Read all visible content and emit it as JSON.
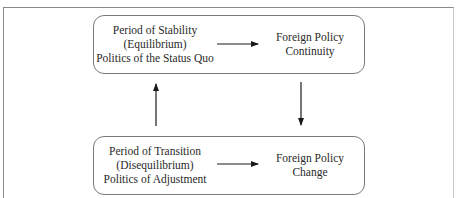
{
  "diagram": {
    "type": "flowchart",
    "nodes": {
      "stability": {
        "lines": [
          "Period of Stability",
          "(Equilibrium)",
          "Politics of the Status Quo"
        ]
      },
      "continuity": {
        "lines": [
          "Foreign Policy",
          "Continuity"
        ]
      },
      "transition": {
        "lines": [
          "Period of Transition",
          "(Disequilibrium)",
          "Politics of Adjustment"
        ]
      },
      "change": {
        "lines": [
          "Foreign Policy",
          "Change"
        ]
      }
    },
    "edges": [
      {
        "from": "stability",
        "to": "continuity",
        "direction": "right"
      },
      {
        "from": "continuity",
        "to": "change",
        "direction": "down"
      },
      {
        "from": "transition",
        "to": "change",
        "direction": "right"
      },
      {
        "from": "transition",
        "to": "stability",
        "direction": "up"
      }
    ],
    "colors": {
      "box_border": "#7a7a7a",
      "arrow": "#1a1a1a",
      "text": "#2a2a2a",
      "background": "#ffffff"
    }
  }
}
